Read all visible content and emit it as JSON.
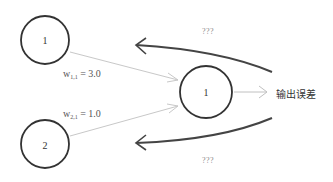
{
  "diagram": {
    "nodes": [
      {
        "id": "input-1",
        "label": "1",
        "cx": 45,
        "cy": 40,
        "r": 24
      },
      {
        "id": "input-2",
        "label": "2",
        "cx": 45,
        "cy": 144,
        "r": 24
      },
      {
        "id": "output-1",
        "label": "1",
        "cx": 206,
        "cy": 92,
        "r": 26
      }
    ],
    "weights": [
      {
        "name": "w",
        "sub": "1,1",
        "eq": "= 3.0"
      },
      {
        "name": "w",
        "sub": "2,1",
        "eq": "= 1.0"
      }
    ],
    "output_label": "输出误差",
    "question_top": "???",
    "question_bottom": "???",
    "colors": {
      "node_stroke": "#333333",
      "link_stroke": "#c8c8c8",
      "back_arrow": "#444444"
    }
  }
}
